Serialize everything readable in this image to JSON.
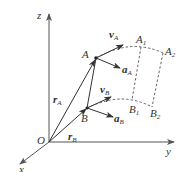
{
  "diagram": {
    "type": "rigid-body-kinematics-3d",
    "axes": {
      "origin_label": "O",
      "x_label": "x",
      "y_label": "y",
      "z_label": "z"
    },
    "points": {
      "A": {
        "label": "A"
      },
      "B": {
        "label": "B"
      },
      "A1": {
        "label": "A",
        "sub": "1"
      },
      "A2": {
        "label": "A",
        "sub": "2"
      },
      "B1": {
        "label": "B",
        "sub": "1"
      },
      "B2": {
        "label": "B",
        "sub": "2"
      }
    },
    "vectors": {
      "rA": {
        "label": "r",
        "sub": "A"
      },
      "rB": {
        "label": "r",
        "sub": "B"
      },
      "vA": {
        "label": "v",
        "sub": "A"
      },
      "aA": {
        "label": "a",
        "sub": "A"
      },
      "vB": {
        "label": "v",
        "sub": "B"
      },
      "aB": {
        "label": "a",
        "sub": "B"
      }
    },
    "colors": {
      "ink": "#333333",
      "axis": "#555555",
      "background": "#ffffff"
    }
  }
}
